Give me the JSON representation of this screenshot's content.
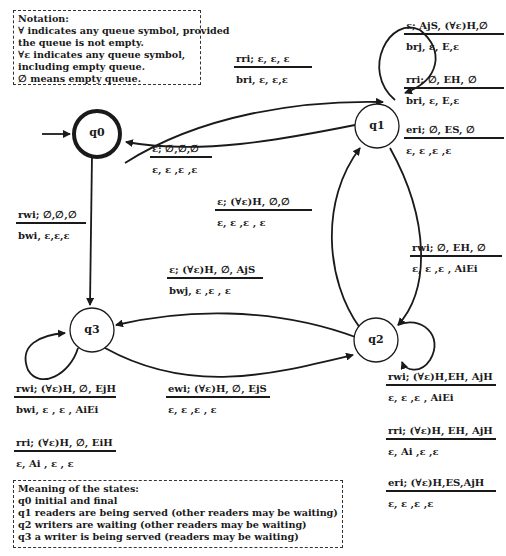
{
  "notation_box": {
    "title": "Notation:",
    "lines": [
      "∀ indicates any queue symbol, provided",
      "the queue is not empty.",
      "∀ε indicates any queue symbol,",
      "including empty queue.",
      "∅ means empty queue."
    ]
  },
  "states_box": {
    "title": "Meaning of the states:",
    "lines": [
      "q0 initial and final",
      "q1 readers are being served (other readers may be waiting)",
      "q2 writers are waiting (other readers may be waiting)",
      "q3 a writer is  being served (readers may be waiting)"
    ]
  },
  "states": [
    {
      "id": "q0",
      "label": "q0",
      "initial": true,
      "final": true
    },
    {
      "id": "q1",
      "label": "q1"
    },
    {
      "id": "q2",
      "label": "q2"
    },
    {
      "id": "q3",
      "label": "q3"
    }
  ],
  "transitions": [
    {
      "from": "q0",
      "to": "q1",
      "condition": "rri; ε, ε, ε",
      "action": "bri, ε, ε,ε"
    },
    {
      "from": "q1",
      "to": "q0",
      "condition": "ε; ∅,∅,∅",
      "action": "ε, ε ,ε ,ε"
    },
    {
      "from": "q1",
      "to": "q1",
      "condition": "ε; AjS, (∀ε)H,∅",
      "action": "brj, ε, E,ε"
    },
    {
      "from": "q1",
      "to": "q1",
      "condition": "rri; ∅, EH, ∅",
      "action": "bri, ε, E,ε"
    },
    {
      "from": "q1",
      "to": "q1",
      "condition": "eri; ∅, ES, ∅",
      "action": "ε, ε ,ε ,ε"
    },
    {
      "from": "q2",
      "to": "q1",
      "condition": "ε; (∀ε)H, ∅,∅",
      "action": "ε, ε ,ε , ε"
    },
    {
      "from": "q0",
      "to": "q3",
      "condition": "rwi; ∅,∅,∅",
      "action": "bwi, ε,ε,ε"
    },
    {
      "from": "q1",
      "to": "q2",
      "condition": "rwi; ∅, EH, ∅",
      "action": "ε, ε ,ε , AiEi"
    },
    {
      "from": "q2",
      "to": "q3",
      "condition": "ε; (∀ε)H, ∅, AjS",
      "action": "bwj, ε ,ε , ε"
    },
    {
      "from": "q3",
      "to": "q2",
      "condition": "ewi; (∀ε)H, ∅, EjS",
      "action": "ε, ε ,ε , ε"
    },
    {
      "from": "q3",
      "to": "q3",
      "condition": "rwi; (∀ε)H, ∅, EjH",
      "action": "bwi, ε , ε , AiEi"
    },
    {
      "from": "q3",
      "to": "q3",
      "condition": "rri; (∀ε)H, ∅, EiH",
      "action": "ε, Ai , ε , ε"
    },
    {
      "from": "q2",
      "to": "q2",
      "condition": "rwi; (∀ε)H,EH, AjH",
      "action": "ε, ε ,ε , AiEi"
    },
    {
      "from": "q2",
      "to": "q2",
      "condition": "rri; (∀ε)H, EH, AjH",
      "action": "ε, Ai ,ε ,ε"
    },
    {
      "from": "q2",
      "to": "q2",
      "condition": "eri; (∀ε)H,ES,AjH",
      "action": "ε, ε ,ε ,ε"
    }
  ]
}
